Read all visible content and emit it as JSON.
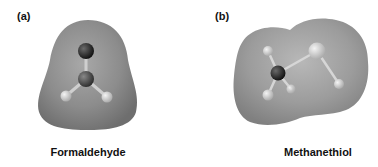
{
  "panels": [
    {
      "label": "(a)",
      "caption": "Formaldehyde",
      "surface_color": "#8a8a8a",
      "atoms": [
        {
          "element": "O",
          "x": 86,
          "y": 51,
          "r": 8,
          "color": "#1a1a1a"
        },
        {
          "element": "C",
          "x": 86,
          "y": 79,
          "r": 8,
          "color": "#3a3a3a"
        },
        {
          "element": "H",
          "x": 66,
          "y": 96,
          "r": 5.5,
          "color": "#d8d8d8"
        },
        {
          "element": "H",
          "x": 107,
          "y": 97,
          "r": 5.5,
          "color": "#d8d8d8"
        }
      ]
    },
    {
      "label": "(b)",
      "caption": "Methanethiol",
      "surface_color": "#9a9a9a",
      "atoms": [
        {
          "element": "C",
          "x": 278,
          "y": 73,
          "r": 7.5,
          "color": "#222222"
        },
        {
          "element": "S",
          "x": 317,
          "y": 51,
          "r": 8.5,
          "color": "#c4c4c4"
        },
        {
          "element": "H",
          "x": 268,
          "y": 51,
          "r": 5,
          "color": "#d4d4d4"
        },
        {
          "element": "H",
          "x": 268,
          "y": 95,
          "r": 5.5,
          "color": "#d4d4d4"
        },
        {
          "element": "H",
          "x": 291,
          "y": 89,
          "r": 4.5,
          "color": "#bdbdbd"
        },
        {
          "element": "H",
          "x": 339,
          "y": 84,
          "r": 5,
          "color": "#d4d4d4"
        }
      ]
    }
  ]
}
